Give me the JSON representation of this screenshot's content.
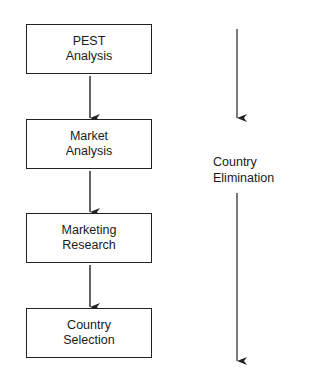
{
  "diagram": {
    "steps": [
      {
        "line1": "PEST",
        "line2": "Analysis"
      },
      {
        "line1": "Market",
        "line2": "Analysis"
      },
      {
        "line1": "Marketing",
        "line2": "Research"
      },
      {
        "line1": "Country",
        "line2": "Selection"
      }
    ],
    "side_label": {
      "line1": "Country",
      "line2": "Elimination"
    },
    "colors": {
      "stroke": "#222222",
      "background": "#ffffff"
    }
  }
}
